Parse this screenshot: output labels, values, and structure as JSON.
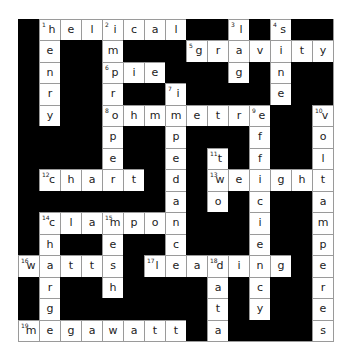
{
  "puzzle": {
    "rows": 15,
    "cols": 15,
    "colors": {
      "block": "#000000",
      "cell": "#ffffff",
      "line": "#9a9a9a",
      "text": "#222222"
    },
    "grid": [
      "#helical##l#s##",
      "#e##m###gravity",
      "#n##pie###g#n##",
      "#r##r##i####e##",
      "#y##ohmmetre##v",
      "####p##p###f##o",
      "####e##e#t#f##l",
      "#chart#d#weight",
      "#######a#o#c##a",
      "#clampon###i##m",
      "#h##e##c###e##p",
      "watts#leading#e",
      "#r##h####a#c##r",
      "#g#######t#y##e",
      "megawatt#a####s"
    ],
    "numbers": [
      {
        "row": 0,
        "col": 1,
        "n": "1"
      },
      {
        "row": 0,
        "col": 4,
        "n": "2"
      },
      {
        "row": 0,
        "col": 10,
        "n": "3"
      },
      {
        "row": 0,
        "col": 12,
        "n": "4"
      },
      {
        "row": 1,
        "col": 8,
        "n": "5"
      },
      {
        "row": 2,
        "col": 4,
        "n": "6"
      },
      {
        "row": 3,
        "col": 7,
        "n": "7"
      },
      {
        "row": 4,
        "col": 4,
        "n": "8"
      },
      {
        "row": 4,
        "col": 11,
        "n": "9"
      },
      {
        "row": 4,
        "col": 14,
        "n": "10"
      },
      {
        "row": 6,
        "col": 9,
        "n": "11"
      },
      {
        "row": 7,
        "col": 1,
        "n": "12"
      },
      {
        "row": 7,
        "col": 9,
        "n": "13"
      },
      {
        "row": 9,
        "col": 1,
        "n": "14"
      },
      {
        "row": 9,
        "col": 4,
        "n": "15"
      },
      {
        "row": 11,
        "col": 0,
        "n": "16"
      },
      {
        "row": 11,
        "col": 6,
        "n": "17"
      },
      {
        "row": 11,
        "col": 9,
        "n": "18"
      },
      {
        "row": 14,
        "col": 0,
        "n": "19"
      }
    ],
    "words": {
      "across": [
        {
          "n": "1",
          "answer": "helical"
        },
        {
          "n": "5",
          "answer": "gravity"
        },
        {
          "n": "6",
          "answer": "pie"
        },
        {
          "n": "8",
          "answer": "ohmmetre"
        },
        {
          "n": "12",
          "answer": "chart"
        },
        {
          "n": "13",
          "answer": "weight"
        },
        {
          "n": "14",
          "answer": "clampon"
        },
        {
          "n": "16",
          "answer": "watts"
        },
        {
          "n": "17",
          "answer": "leading"
        },
        {
          "n": "19",
          "answer": "megawatt"
        }
      ],
      "down": [
        {
          "n": "1",
          "answer": "henry"
        },
        {
          "n": "2",
          "answer": "improper"
        },
        {
          "n": "3",
          "answer": "lag"
        },
        {
          "n": "4",
          "answer": "sine"
        },
        {
          "n": "7",
          "answer": "impedance"
        },
        {
          "n": "9",
          "answer": "efficiency"
        },
        {
          "n": "10",
          "answer": "voltamperes"
        },
        {
          "n": "11",
          "answer": "two"
        },
        {
          "n": "14",
          "answer": "chart"
        },
        {
          "n": "15",
          "answer": "mesh"
        },
        {
          "n": "16",
          "answer": ""
        },
        {
          "n": "18",
          "answer": "data"
        }
      ]
    }
  }
}
